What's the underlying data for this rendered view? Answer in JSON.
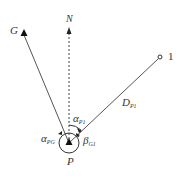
{
  "diagram": {
    "labels": {
      "north": "N",
      "backsight": "G",
      "station": "P",
      "point": "1",
      "distance": {
        "main": "D",
        "sub": "P1"
      },
      "azimuth_p1": {
        "main": "α",
        "sub": "P1"
      },
      "azimuth_pg": {
        "main": "α",
        "sub": "PG"
      },
      "angle_g1": {
        "main": "β",
        "sub": "G1"
      }
    },
    "colors": {
      "line": "#444444",
      "text": "#333333"
    }
  }
}
